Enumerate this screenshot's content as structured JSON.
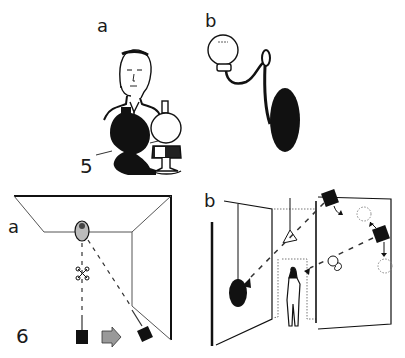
{
  "figure": {
    "panels": [
      {
        "id": "5a",
        "label": "a",
        "description": "Man seated behind an oil lamp casting a large black shadow"
      },
      {
        "id": "5b",
        "label": "b",
        "description": "Wall sconce with globe lamp and black shadow on wall"
      },
      {
        "id": "6a",
        "label": "a",
        "description": "Top-down plan of room corner: figure, light, and camera/spotlight moved position with dashed sightlines"
      },
      {
        "id": "6b",
        "label": "b",
        "description": "Perspective of stage flats: spotlights project dashed beams, figure stands in doorway, black circular shadow on left flat"
      }
    ],
    "figure_numbers": [
      "5",
      "6"
    ]
  },
  "colors": {
    "ink": "#111111",
    "paper": "#ffffff",
    "line": "#555555"
  }
}
